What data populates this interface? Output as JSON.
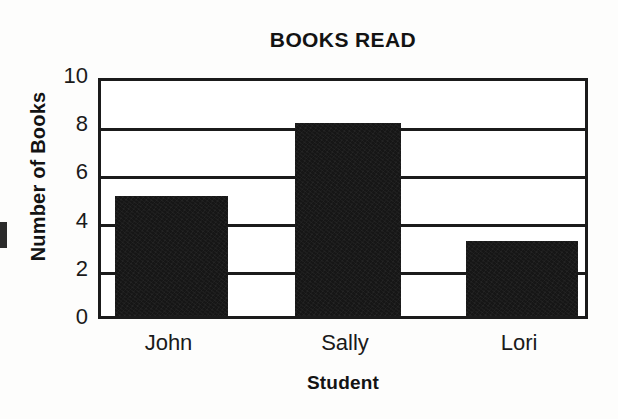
{
  "chart_data": {
    "type": "bar",
    "title": "BOOKS READ",
    "xlabel": "Student",
    "ylabel": "Number of Books",
    "categories": [
      "John",
      "Sally",
      "Lori"
    ],
    "values": [
      5,
      8,
      3.1
    ],
    "series": [
      {
        "name": "Books Read",
        "values": [
          5,
          8,
          3.1
        ]
      }
    ],
    "ylim": [
      0,
      10
    ],
    "yticks": [
      0,
      2,
      4,
      6,
      8,
      10
    ],
    "ytick_labels": [
      "0",
      "2",
      "4",
      "6",
      "8",
      "10"
    ],
    "grid": "horizontal",
    "legend": "none",
    "bar_color": "#161616",
    "frame_color": "#1b1b1b",
    "background_color": "#ffffff"
  },
  "figure": {
    "title": "BOOKS READ",
    "x_axis_title": "Student",
    "y_axis_title": "Number of Books"
  },
  "artifact": {
    "label": "scan-edge-mark"
  }
}
